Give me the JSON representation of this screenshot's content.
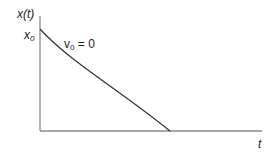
{
  "diagram": {
    "type": "position-time graph",
    "y_axis_label": "x(t)",
    "x_axis_label": "t",
    "initial_value_label": {
      "base": "x",
      "sub": "0"
    },
    "curve_annotation": {
      "base": "v",
      "sub": "0",
      "rest": " = 0"
    },
    "colors": {
      "axis": "#888888",
      "curve": "#333333",
      "text": "#222222"
    }
  }
}
